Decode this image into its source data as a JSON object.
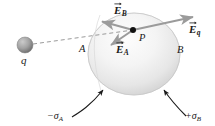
{
  "figure": {
    "background_color": "#ffffff",
    "ink_color": "#1a1a1a",
    "sphere_shade_light": "#fbfbfb",
    "sphere_shade_mid": "#e9e9e9",
    "sphere_shade_dark": "#cfcfcf",
    "charge_shade_light": "#c9c9c9",
    "charge_shade_dark": "#6f6f6f"
  },
  "labels": {
    "charge_q": "q",
    "point_p": "P",
    "region_a": "A",
    "region_b": "B",
    "field_b_main": "E",
    "field_b_sub": "B",
    "field_a_main": "E",
    "field_a_sub": "A",
    "field_q_main": "E",
    "field_q_sub": "q",
    "sigma_a": "−σ",
    "sigma_a_sub": "A",
    "sigma_b": "+σ",
    "sigma_b_sub": "B"
  },
  "geometry": {
    "point_p": {
      "x": 133,
      "y": 30
    },
    "charge_q": {
      "x": 25,
      "y": 45,
      "r": 8
    },
    "sphere": {
      "cx": 134,
      "cy": 54,
      "rx": 46,
      "ry": 41
    },
    "vectors": [
      {
        "name": "E_B",
        "from": [
          133,
          30
        ],
        "to": [
          99,
          21
        ]
      },
      {
        "name": "E_A",
        "from": [
          133,
          30
        ],
        "to": [
          108,
          47
        ]
      },
      {
        "name": "E_q",
        "from": [
          133,
          30
        ],
        "to": [
          196,
          16
        ]
      }
    ],
    "dashed_line": {
      "from": [
        33,
        44
      ],
      "to": [
        133,
        30
      ]
    }
  }
}
